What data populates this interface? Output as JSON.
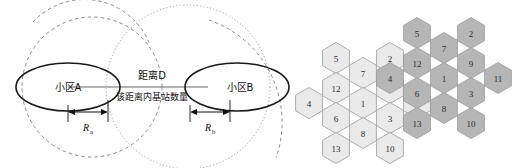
{
  "figure": {
    "background": "#ffffff",
    "left_panel": {
      "name": "two-cell-distance-diagram",
      "cell_a_label": "小区A",
      "cell_b_label": "小区B",
      "distance_label": "距离D",
      "count_label": "该距离内基站数量",
      "radius_a_label": "R",
      "radius_a_sub": "a",
      "radius_b_label": "R",
      "radius_b_sub": "b",
      "ellipse_stroke": "#1a1a1a",
      "dashed_stroke": "#6e6e6e",
      "dotted_stroke": "#8a8a8a",
      "connector_stroke": "#6b6b6b",
      "ellipse_a": {
        "cx": 68,
        "cy": 87,
        "rx": 50,
        "ry": 24
      },
      "ellipse_b": {
        "cx": 205,
        "cy": 87,
        "rx": 50,
        "ry": 24
      },
      "dashed_circle_a": {
        "cx": 68,
        "cy": 87,
        "r": 65
      },
      "dotted_circle_b": {
        "cx": 205,
        "cy": 87,
        "r": 81
      },
      "outer_arc": {
        "cx": 205,
        "cy": 87,
        "r": 110
      },
      "distance_line": {
        "x1": 68,
        "y1": 87,
        "x2": 205,
        "y2": 87
      },
      "dim_a": {
        "x1": 68,
        "x2": 118,
        "y": 114
      },
      "dim_b": {
        "x1": 186,
        "x2": 236,
        "y": 114
      }
    },
    "right_panel": {
      "name": "hex-reuse-cluster-pair",
      "hex_radius": 15.5,
      "light_fill": "#eaeaea",
      "dark_fill": "#b6b6b6",
      "border": "#9a9a9a",
      "number_color": "#2b2b2b",
      "clusters": [
        {
          "name": "cluster-light",
          "fill_key": "light_fill",
          "cells": [
            {
              "id": "5",
              "cx": 336,
              "cy": 58
            },
            {
              "id": "2",
              "cx": 390,
              "cy": 58
            },
            {
              "id": "7",
              "cx": 363,
              "cy": 73
            },
            {
              "id": "12",
              "cx": 336,
              "cy": 88
            },
            {
              "id": "9",
              "cx": 390,
              "cy": 88
            },
            {
              "id": "4",
              "cx": 309,
              "cy": 103
            },
            {
              "id": "1",
              "cx": 363,
              "cy": 103
            },
            {
              "id": "11",
              "cx": 417,
              "cy": 103
            },
            {
              "id": "6",
              "cx": 336,
              "cy": 118
            },
            {
              "id": "3",
              "cx": 390,
              "cy": 118
            },
            {
              "id": "8",
              "cx": 363,
              "cy": 133
            },
            {
              "id": "13",
              "cx": 336,
              "cy": 148
            },
            {
              "id": "10",
              "cx": 390,
              "cy": 148
            }
          ]
        },
        {
          "name": "cluster-dark",
          "fill_key": "dark_fill",
          "cells": [
            {
              "id": "5",
              "cx": 417,
              "cy": 33
            },
            {
              "id": "2",
              "cx": 471,
              "cy": 33
            },
            {
              "id": "7",
              "cx": 444,
              "cy": 48
            },
            {
              "id": "12",
              "cx": 417,
              "cy": 63
            },
            {
              "id": "9",
              "cx": 471,
              "cy": 63
            },
            {
              "id": "4",
              "cx": 390,
              "cy": 78
            },
            {
              "id": "1",
              "cx": 444,
              "cy": 78
            },
            {
              "id": "11",
              "cx": 498,
              "cy": 78
            },
            {
              "id": "6",
              "cx": 417,
              "cy": 93
            },
            {
              "id": "3",
              "cx": 471,
              "cy": 93
            },
            {
              "id": "8",
              "cx": 444,
              "cy": 108
            },
            {
              "id": "13",
              "cx": 417,
              "cy": 123
            },
            {
              "id": "10",
              "cx": 471,
              "cy": 123
            }
          ]
        }
      ]
    }
  }
}
